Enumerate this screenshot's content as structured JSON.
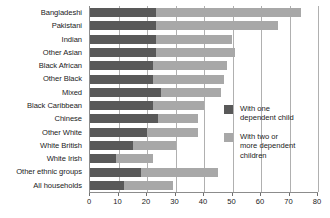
{
  "chart_data": {
    "type": "bar",
    "orientation": "horizontal",
    "stacked": true,
    "title": "",
    "xlabel": "",
    "ylabel": "",
    "xlim": [
      0,
      80
    ],
    "xticks": [
      0,
      10,
      20,
      30,
      40,
      50,
      60,
      70,
      80
    ],
    "xtick_labels": [
      "0",
      "10",
      "20",
      "30",
      "40",
      "50",
      "60",
      "70",
      "80"
    ],
    "grid": true,
    "grid_axis": "x",
    "legend_position": "right",
    "categories": [
      "Bangladeshi",
      "Pakistani",
      "Indian",
      "Other Asian",
      "Black African",
      "Other Black",
      "Mixed",
      "Black Caribbean",
      "Chinese",
      "Other White",
      "White British",
      "White Irish",
      "Other ethnic groups",
      "All households"
    ],
    "series": [
      {
        "name": "With one dependent child",
        "color": "#595959",
        "values": [
          23,
          23,
          23,
          23,
          22,
          22,
          25,
          22,
          24,
          20,
          15,
          9,
          18,
          12
        ]
      },
      {
        "name": "With two or more dependent children",
        "color": "#a8a8a8",
        "values": [
          51,
          43,
          27,
          28,
          26,
          25,
          21,
          18,
          14,
          18,
          15,
          13,
          27,
          17
        ]
      }
    ],
    "totals": [
      74,
      66,
      50,
      51,
      48,
      47,
      46,
      40,
      38,
      38,
      30,
      22,
      45,
      29
    ]
  },
  "legend": {
    "entries": [
      {
        "label": "With one\ndependent child",
        "swatch": "one"
      },
      {
        "label": "With two or\nmore dependent\nchildren",
        "swatch": "two"
      }
    ]
  },
  "colors": {
    "series_one": "#595959",
    "series_two": "#a8a8a8",
    "axis": "#8c8c8c",
    "gridline": "#b0b0b0",
    "text": "#1a1a1a",
    "background": "#ffffff"
  }
}
